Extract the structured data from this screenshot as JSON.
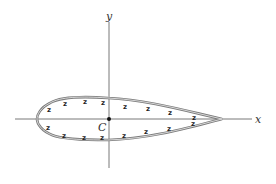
{
  "figure": {
    "type": "airfoil-cross-section",
    "axes": {
      "x_label": "x",
      "y_label": "y"
    },
    "origin_point": {
      "label": "C"
    },
    "hatch_glyph": "z",
    "colors": {
      "outline": "#7a7a7a",
      "axis": "#555555",
      "text": "#333333",
      "background": "#ffffff"
    }
  }
}
